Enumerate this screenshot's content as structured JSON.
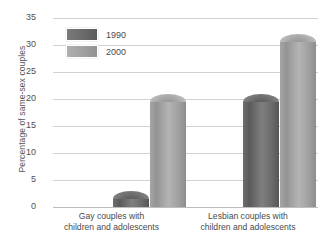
{
  "chart_data": {
    "type": "bar",
    "title": "",
    "xlabel": "",
    "ylabel": "Percentage of same-sex couples",
    "ylim": [
      0,
      35
    ],
    "yticks": [
      0,
      5,
      10,
      15,
      20,
      25,
      30,
      35
    ],
    "grid": true,
    "legend_position": "inside-top-left",
    "categories": [
      "Gay couples with children and adolescents",
      "Lesbian couples with children and adolescents"
    ],
    "series": [
      {
        "name": "1990",
        "values": [
          3,
          21
        ],
        "color": "#6b6b6b"
      },
      {
        "name": "2000",
        "values": [
          21,
          32
        ],
        "color": "#a5a5a5"
      }
    ]
  },
  "axis": {
    "y_title": "Percentage of same-sex couples",
    "tick_labels": [
      "35",
      "30",
      "25",
      "20",
      "15",
      "10",
      "5",
      "0"
    ]
  },
  "legend": {
    "entries": [
      {
        "label": "1990"
      },
      {
        "label": "2000"
      }
    ]
  },
  "categories": {
    "items": [
      {
        "line1": "Gay couples with",
        "line2": "children and adolescents"
      },
      {
        "line1": "Lesbian couples with",
        "line2": "children and adolescents"
      }
    ]
  },
  "footer": {
    "text": ""
  }
}
